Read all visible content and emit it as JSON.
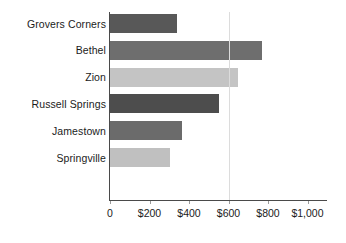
{
  "chart_data": {
    "type": "bar",
    "orientation": "horizontal",
    "title": "",
    "subtitle": "",
    "xlabel": "",
    "ylabel": "",
    "categories": [
      "Grovers Corners",
      "Bethel",
      "Zion",
      "Russell Springs",
      "Jamestown",
      "Springville"
    ],
    "values": [
      340,
      770,
      650,
      550,
      365,
      305
    ],
    "xlim": [
      0,
      1000
    ],
    "xticks": [
      0,
      200,
      400,
      600,
      800,
      1000
    ],
    "xtick_labels": [
      "0",
      "$200",
      "$400",
      "$600",
      "$800",
      "$1,000"
    ],
    "grid": true,
    "gridlines_at": [
      600
    ],
    "legend": null,
    "bar_colors": [
      "#585858",
      "#6e6e6e",
      "#c4c4c4",
      "#4d4d4d",
      "#6b6b6b",
      "#c0c0c0"
    ],
    "series": [
      {
        "name": "Amount",
        "values": [
          340,
          770,
          650,
          550,
          365,
          305
        ]
      }
    ],
    "bars": [
      {
        "label": "Grovers Corners",
        "value": 340,
        "color": "#585858"
      },
      {
        "label": "Bethel",
        "value": 770,
        "color": "#6e6e6e"
      },
      {
        "label": "Zion",
        "value": 650,
        "color": "#c4c4c4"
      },
      {
        "label": "Russell Springs",
        "value": 550,
        "color": "#4d4d4d"
      },
      {
        "label": "Jamestown",
        "value": 365,
        "color": "#6b6b6b"
      },
      {
        "label": "Springville",
        "value": 305,
        "color": "#c0c0c0"
      }
    ]
  },
  "axis": {
    "tick_labels": [
      "0",
      "$200",
      "$400",
      "$600",
      "$800",
      "$1,000"
    ],
    "axis_color": "#4a4a4a",
    "gridline_color": "#dcdcdc"
  }
}
